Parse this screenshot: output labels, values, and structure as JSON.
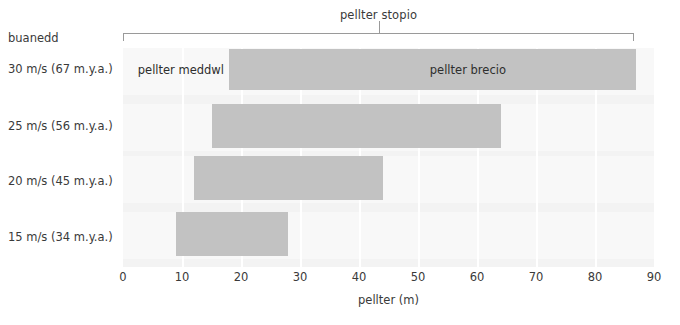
{
  "chart_data": {
    "type": "bar",
    "orientation": "horizontal",
    "subtype": "stacked-range",
    "title": "pellter stopio",
    "xlabel": "pellter (m)",
    "ylabel": "buanedd",
    "xlim": [
      0,
      90
    ],
    "xticks": [
      0,
      10,
      20,
      30,
      40,
      50,
      60,
      70,
      80,
      90
    ],
    "xticklabels": [
      "0",
      "10",
      "20",
      "30",
      "40",
      "50",
      "60",
      "70",
      "80",
      "90"
    ],
    "grid": "vertical-white",
    "legend": "none",
    "categories": [
      "30 m/s (67 m.y.a.)",
      "25 m/s (56 m.y.a.)",
      "20 m/s (45 m.y.a.)",
      "15 m/s (34 m.y.a.)"
    ],
    "segment_names": [
      "pellter meddwl",
      "pellter brecio"
    ],
    "series": [
      {
        "name": "pellter meddwl",
        "values": [
          18,
          15,
          12,
          9
        ]
      },
      {
        "name": "pellter brecio",
        "values": [
          69,
          49,
          32,
          19
        ]
      }
    ],
    "bars": [
      {
        "category": "30 m/s (67 m.y.a.)",
        "start": 18,
        "end": 87,
        "total": 87
      },
      {
        "category": "25 m/s (56 m.y.a.)",
        "start": 15,
        "end": 64,
        "total": 64
      },
      {
        "category": "20 m/s (45 m.y.a.)",
        "start": 12,
        "end": 44,
        "total": 44
      },
      {
        "category": "15 m/s (34 m.y.a.)",
        "start": 9,
        "end": 28,
        "total": 28
      }
    ],
    "inline_labels": [
      {
        "text": "pellter meddwl",
        "row": 0,
        "at": 2.5
      },
      {
        "text": "pellter brecio",
        "row": 0,
        "at": 52
      }
    ],
    "colors": {
      "bar": "#c2c2c2",
      "plot_background": "#f3f3f3",
      "gridline": "#ffffff",
      "text": "#3a3a3a",
      "bracket": "#9a9a9a",
      "page_background": "#ffffff"
    }
  }
}
